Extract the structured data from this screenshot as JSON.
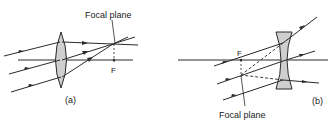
{
  "figure": {
    "panel_a": {
      "label": "(a)",
      "lens_type": "converging",
      "focal_plane_label": "Focal plane",
      "focal_point_label": "F"
    },
    "panel_b": {
      "label": "(b)",
      "lens_type": "diverging",
      "focal_plane_label": "Focal plane",
      "focal_point_label": "F"
    },
    "colors": {
      "line": "#2a2a2a",
      "lens_fill": "#cfcfcf",
      "background": "#ffffff"
    }
  }
}
